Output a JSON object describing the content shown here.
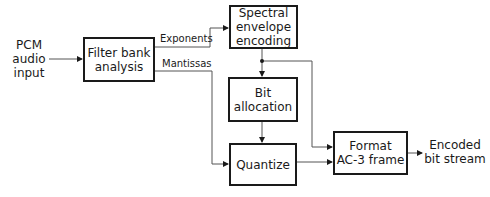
{
  "diagram": {
    "input_label": "PCM\naudio\ninput",
    "output_label": "Encoded\nbit stream",
    "blocks": {
      "filter_bank": "Filter bank\nanalysis",
      "spectral": "Spectral\nenvelope\nencoding",
      "bit_alloc": "Bit\nallocation",
      "quantize": "Quantize",
      "format": "Format\nAC-3 frame"
    },
    "edges": {
      "exponents": "Exponents",
      "mantissas": "Mantissas"
    },
    "colors": {
      "line": "#1a1a1a",
      "connector": "#555555"
    }
  }
}
